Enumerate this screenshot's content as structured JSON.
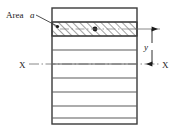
{
  "figure": {
    "background_color": "#ffffff",
    "line_color": "#3a3a3a",
    "hatch_color": "#555555",
    "text_color": "#1a1a1a"
  },
  "labels": {
    "area_label": "Area",
    "area_symbol": "a",
    "axis_left": "X",
    "axis_right": "X",
    "distance_symbol": "y"
  },
  "geometry": {
    "section": {
      "left": 52,
      "right": 137,
      "top": 8,
      "bottom": 124,
      "strip_count": 8
    },
    "hatched_strip": {
      "top": 22,
      "bottom": 36,
      "centroid_x": 95,
      "centroid_y": 29
    },
    "neutral_axis_y": 64,
    "dimension_line_x": 152
  }
}
